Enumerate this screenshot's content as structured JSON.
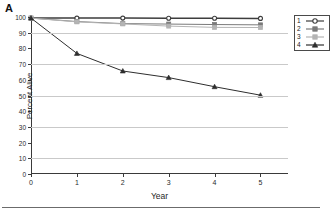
{
  "panel": {
    "label": "A"
  },
  "chart_data": {
    "type": "line",
    "title": "",
    "xlabel": "Year",
    "ylabel": "Percent Alive",
    "x": [
      0,
      1,
      2,
      3,
      4,
      5
    ],
    "xlim": [
      0,
      5.6
    ],
    "ylim": [
      0,
      100
    ],
    "xticks": [
      "0",
      "1",
      "2",
      "3",
      "4",
      "5"
    ],
    "yticks": [
      "0",
      "10",
      "20",
      "30",
      "40",
      "50",
      "60",
      "70",
      "80",
      "90",
      "100"
    ],
    "gridlines": [
      10,
      30,
      50,
      70,
      90
    ],
    "grid": true,
    "legend_position": "upper-right",
    "series": [
      {
        "name": "1",
        "label": "1",
        "marker": "circle",
        "color": "#3d3d3d",
        "values": [
          99.3,
          99.3,
          99.3,
          99.2,
          99.2,
          99.1
        ]
      },
      {
        "name": "2",
        "label": "2",
        "marker": "square",
        "color": "#7a7a7a",
        "values": [
          99.3,
          97.1,
          95.8,
          95.5,
          95.2,
          95.0
        ]
      },
      {
        "name": "3",
        "label": "3",
        "marker": "square",
        "color": "#b4b4b4",
        "values": [
          99.3,
          96.9,
          95.6,
          94.2,
          93.4,
          93.3
        ]
      },
      {
        "name": "4",
        "label": "4",
        "marker": "triangle",
        "color": "#2e2e2e",
        "values": [
          99.3,
          76.8,
          65.6,
          61.4,
          55.6,
          50.2
        ]
      }
    ]
  }
}
